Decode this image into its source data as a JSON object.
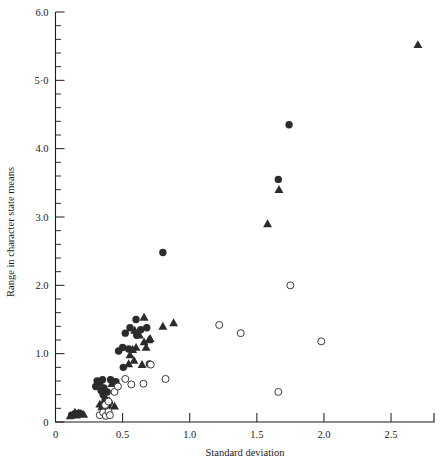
{
  "figure": {
    "background_color": "#ffffff",
    "ink_color": "#1a1a1a",
    "marker_color": "#2b2b2b"
  },
  "chart_data": {
    "type": "scatter",
    "title": "",
    "xlabel": "Standard deviation",
    "ylabel": "Range in character state means",
    "xlim": [
      0,
      2.82
    ],
    "ylim": [
      0,
      6.0
    ],
    "grid": false,
    "legend_position": "none",
    "xticks": [
      0,
      0.5,
      1.0,
      1.5,
      2.0,
      2.5
    ],
    "xtick_labels": [
      "0",
      "0.5",
      "1.0",
      "1.5",
      "2.0",
      "2.5"
    ],
    "yticks": [
      0,
      1.0,
      2.0,
      3.0,
      4.0,
      5.0,
      6.0
    ],
    "ytick_labels": [
      "0",
      "1.0",
      "2.0",
      "3.0",
      "4.0",
      "5·0",
      "6.0"
    ],
    "y_minor_tick_step": 0.2,
    "x_minor_ticks": false,
    "series": [
      {
        "name": "filled-circle",
        "marker": "filled-circle",
        "points": [
          [
            0.12,
            0.1
          ],
          [
            0.15,
            0.12
          ],
          [
            0.18,
            0.13
          ],
          [
            0.3,
            0.52
          ],
          [
            0.31,
            0.6
          ],
          [
            0.33,
            0.57
          ],
          [
            0.34,
            0.46
          ],
          [
            0.35,
            0.62
          ],
          [
            0.355,
            0.4
          ],
          [
            0.36,
            0.5
          ],
          [
            0.37,
            0.33
          ],
          [
            0.385,
            0.44
          ],
          [
            0.4,
            0.28
          ],
          [
            0.41,
            0.62
          ],
          [
            0.45,
            0.59
          ],
          [
            0.47,
            1.04
          ],
          [
            0.5,
            1.09
          ],
          [
            0.505,
            0.8
          ],
          [
            0.52,
            1.3
          ],
          [
            0.545,
            1.07
          ],
          [
            0.555,
            1.38
          ],
          [
            0.6,
            1.5
          ],
          [
            0.605,
            1.27
          ],
          [
            0.635,
            1.35
          ],
          [
            0.68,
            1.38
          ],
          [
            0.7,
            0.85
          ],
          [
            0.8,
            2.48
          ],
          [
            1.74,
            4.35
          ],
          [
            1.66,
            3.55
          ]
        ]
      },
      {
        "name": "filled-triangle",
        "marker": "filled-triangle",
        "points": [
          [
            0.11,
            0.09
          ],
          [
            0.13,
            0.11
          ],
          [
            0.145,
            0.14
          ],
          [
            0.155,
            0.1
          ],
          [
            0.17,
            0.13
          ],
          [
            0.19,
            0.12
          ],
          [
            0.21,
            0.11
          ],
          [
            0.33,
            0.26
          ],
          [
            0.345,
            0.22
          ],
          [
            0.36,
            0.3
          ],
          [
            0.375,
            0.2
          ],
          [
            0.39,
            0.25
          ],
          [
            0.4,
            0.31
          ],
          [
            0.42,
            0.56
          ],
          [
            0.44,
            0.23
          ],
          [
            0.545,
            0.85
          ],
          [
            0.555,
            0.98
          ],
          [
            0.575,
            1.06
          ],
          [
            0.585,
            0.9
          ],
          [
            0.6,
            1.09
          ],
          [
            0.625,
            1.27
          ],
          [
            0.645,
            0.84
          ],
          [
            0.66,
            1.17
          ],
          [
            0.675,
            1.09
          ],
          [
            0.695,
            1.2
          ],
          [
            0.705,
            1.22
          ],
          [
            0.59,
            1.34
          ],
          [
            0.66,
            1.53
          ],
          [
            0.8,
            1.4
          ],
          [
            0.88,
            1.45
          ],
          [
            1.58,
            2.9
          ],
          [
            1.665,
            3.4
          ],
          [
            2.7,
            5.52
          ]
        ]
      },
      {
        "name": "open-circle",
        "marker": "open-circle",
        "points": [
          [
            0.33,
            0.1
          ],
          [
            0.355,
            0.14
          ],
          [
            0.375,
            0.09
          ],
          [
            0.395,
            0.15
          ],
          [
            0.405,
            0.1
          ],
          [
            0.37,
            0.25
          ],
          [
            0.395,
            0.3
          ],
          [
            0.44,
            0.44
          ],
          [
            0.465,
            0.52
          ],
          [
            0.52,
            0.63
          ],
          [
            0.565,
            0.55
          ],
          [
            0.655,
            0.56
          ],
          [
            0.71,
            0.84
          ],
          [
            0.82,
            0.63
          ],
          [
            1.22,
            1.42
          ],
          [
            1.38,
            1.3
          ],
          [
            1.75,
            2.0
          ],
          [
            1.98,
            1.18
          ],
          [
            1.66,
            0.44
          ]
        ]
      }
    ]
  }
}
